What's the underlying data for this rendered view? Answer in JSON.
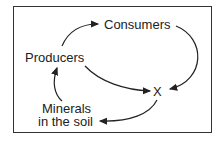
{
  "diagram": {
    "nodes": [
      {
        "id": "producers",
        "label": "Producers"
      },
      {
        "id": "consumers",
        "label": "Consumers"
      },
      {
        "id": "x",
        "label": "X"
      },
      {
        "id": "minerals",
        "label_line1": "Minerals",
        "label_line2": "in the soil"
      }
    ],
    "edges": [
      {
        "from": "producers",
        "to": "consumers"
      },
      {
        "from": "consumers",
        "to": "x"
      },
      {
        "from": "producers",
        "to": "x"
      },
      {
        "from": "x",
        "to": "minerals"
      },
      {
        "from": "minerals",
        "to": "producers"
      }
    ]
  }
}
